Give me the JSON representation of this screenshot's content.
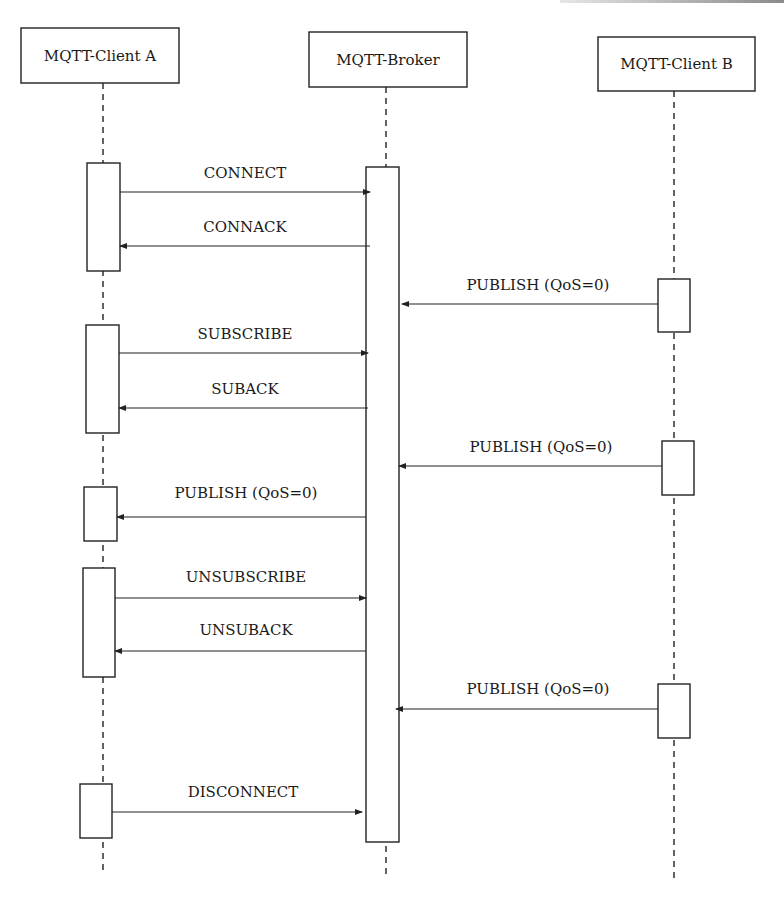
{
  "diagram": {
    "type": "sequence",
    "actors": [
      {
        "id": "A",
        "label": "MQTT-Client A",
        "box": {
          "x": 21,
          "y": 28,
          "w": 158,
          "h": 55
        },
        "lifeline_x": 103,
        "lifeline_end": 872
      },
      {
        "id": "Broker",
        "label": "MQTT-Broker",
        "box": {
          "x": 309,
          "y": 32,
          "w": 158,
          "h": 55
        },
        "lifeline_x": 386,
        "lifeline_end": 875
      },
      {
        "id": "B",
        "label": "MQTT-Client B",
        "box": {
          "x": 598,
          "y": 37,
          "w": 157,
          "h": 54
        },
        "lifeline_x": 674,
        "lifeline_end": 880
      }
    ],
    "activations": [
      {
        "actor": "A",
        "x": 87,
        "y": 163,
        "w": 33,
        "h": 108
      },
      {
        "actor": "A",
        "x": 86,
        "y": 325,
        "w": 33,
        "h": 108
      },
      {
        "actor": "A",
        "x": 84,
        "y": 487,
        "w": 33,
        "h": 54
      },
      {
        "actor": "A",
        "x": 83,
        "y": 568,
        "w": 32,
        "h": 109
      },
      {
        "actor": "A",
        "x": 80,
        "y": 784,
        "w": 32,
        "h": 54
      },
      {
        "actor": "Broker",
        "x": 366,
        "y": 167,
        "w": 33,
        "h": 675
      },
      {
        "actor": "B",
        "x": 658,
        "y": 279,
        "w": 32,
        "h": 53
      },
      {
        "actor": "B",
        "x": 662,
        "y": 441,
        "w": 32,
        "h": 54
      },
      {
        "actor": "B",
        "x": 658,
        "y": 684,
        "w": 32,
        "h": 54
      }
    ],
    "messages": [
      {
        "label": "CONNECT",
        "from": "A",
        "to": "Broker",
        "x1": 120,
        "x2": 370,
        "y": 192,
        "label_x": 245,
        "label_y": 178
      },
      {
        "label": "CONNACK",
        "from": "Broker",
        "to": "A",
        "x1": 370,
        "x2": 120,
        "y": 246,
        "label_x": 245,
        "label_y": 232
      },
      {
        "label": "PUBLISH (QoS=0)",
        "from": "B",
        "to": "Broker",
        "x1": 658,
        "x2": 402,
        "y": 304,
        "label_x": 538,
        "label_y": 290
      },
      {
        "label": "SUBSCRIBE",
        "from": "A",
        "to": "Broker",
        "x1": 119,
        "x2": 368,
        "y": 353,
        "label_x": 245,
        "label_y": 339
      },
      {
        "label": "SUBACK",
        "from": "Broker",
        "to": "A",
        "x1": 368,
        "x2": 119,
        "y": 408,
        "label_x": 245,
        "label_y": 394
      },
      {
        "label": "PUBLISH (QoS=0)",
        "from": "B",
        "to": "Broker",
        "x1": 662,
        "x2": 399,
        "y": 466,
        "label_x": 541,
        "label_y": 452
      },
      {
        "label": "PUBLISH (QoS=0)",
        "from": "Broker",
        "to": "A",
        "x1": 366,
        "x2": 117,
        "y": 517,
        "label_x": 246,
        "label_y": 498
      },
      {
        "label": "UNSUBSCRIBE",
        "from": "A",
        "to": "Broker",
        "x1": 115,
        "x2": 366,
        "y": 598,
        "label_x": 246,
        "label_y": 582
      },
      {
        "label": "UNSUBACK",
        "from": "Broker",
        "to": "A",
        "x1": 366,
        "x2": 115,
        "y": 651,
        "label_x": 246,
        "label_y": 635
      },
      {
        "label": "PUBLISH (QoS=0)",
        "from": "B",
        "to": "Broker",
        "x1": 658,
        "x2": 396,
        "y": 709,
        "label_x": 538,
        "label_y": 694
      },
      {
        "label": "DISCONNECT",
        "from": "A",
        "to": "Broker",
        "x1": 112,
        "x2": 362,
        "y": 812,
        "label_x": 243,
        "label_y": 797
      }
    ]
  }
}
